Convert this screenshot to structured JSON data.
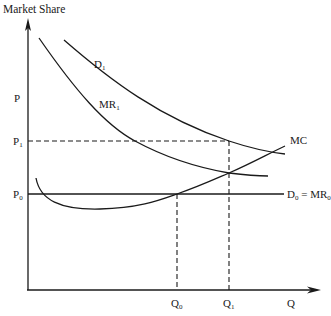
{
  "diagram": {
    "title": "Market Share",
    "y_axis": {
      "label": "P"
    },
    "x_axis": {
      "label": "Q"
    },
    "price_levels": [
      {
        "id": "p1",
        "base": "P",
        "sub": "1"
      },
      {
        "id": "p0",
        "base": "P",
        "sub": "0"
      }
    ],
    "quantity_levels": [
      {
        "id": "q0",
        "base": "Q",
        "sub": "0"
      },
      {
        "id": "q1",
        "base": "Q",
        "sub": "1"
      }
    ],
    "curves": [
      {
        "id": "d1",
        "base": "D",
        "sub": "1",
        "kind": "demand"
      },
      {
        "id": "mr1",
        "base": "MR",
        "sub": "1",
        "kind": "marginal revenue"
      },
      {
        "id": "mc",
        "base": "MC",
        "sub": "",
        "kind": "marginal cost"
      },
      {
        "id": "d0mr0",
        "base": "D",
        "sub": "0",
        "eq": " = ",
        "base2": "MR",
        "sub2": "0",
        "kind": "horizontal demand = marginal revenue"
      }
    ],
    "colors": {
      "line": "#1a1a1a",
      "background": "#ffffff"
    }
  }
}
